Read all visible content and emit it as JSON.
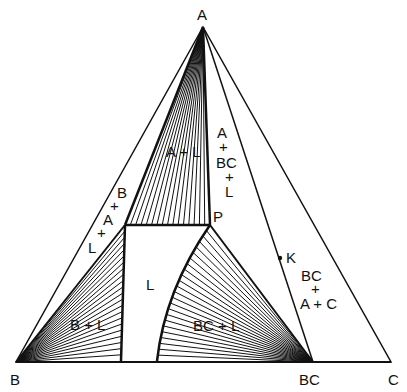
{
  "diagram": {
    "vertices": {
      "A": {
        "label": "A",
        "x": 203,
        "y": 27
      },
      "B": {
        "label": "B",
        "x": 16,
        "y": 362
      },
      "C": {
        "label": "C",
        "x": 391,
        "y": 362
      },
      "BC": {
        "label": "BC",
        "x": 313,
        "y": 362
      }
    },
    "points": {
      "P": {
        "label": "P",
        "x": 210,
        "y": 225
      },
      "K": {
        "label": "K",
        "x": 280,
        "y": 258
      }
    },
    "regions": {
      "a_plus_l": "A + L",
      "a_bc_l": [
        "A",
        "+",
        "BC",
        "+",
        "L"
      ],
      "b_a_l": [
        "B",
        "+",
        "A",
        "+",
        "L"
      ],
      "l": "L",
      "b_plus_l": "B + L",
      "bc_plus_l": "BC + L",
      "bc_a_c": [
        "BC",
        "+",
        "A + C"
      ]
    },
    "colors": {
      "line": "#111111",
      "background": "#ffffff"
    }
  }
}
